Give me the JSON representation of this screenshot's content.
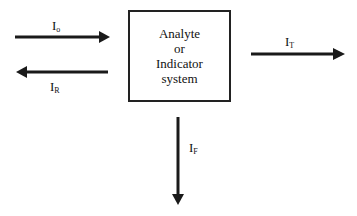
{
  "diagram": {
    "box": {
      "lines": [
        "Analyte",
        "or",
        "Indicator",
        "system"
      ]
    },
    "labels": {
      "incident": {
        "main": "I",
        "sub": "o"
      },
      "reflected": {
        "main": "I",
        "sub": "R"
      },
      "transmitted": {
        "main": "I",
        "sub": "T"
      },
      "fluorescent": {
        "main": "I",
        "sub": "F"
      }
    },
    "colors": {
      "stroke": "#1a1a1a",
      "background": "#ffffff"
    }
  }
}
